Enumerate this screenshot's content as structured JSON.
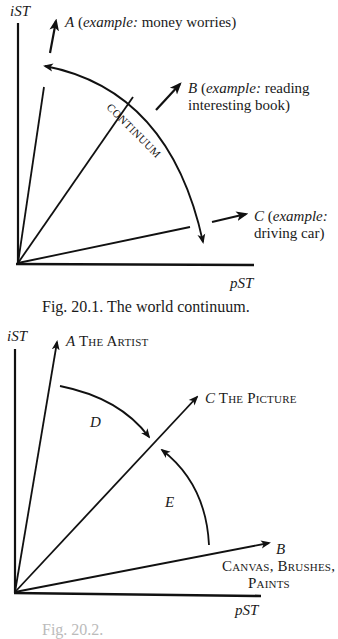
{
  "figure1": {
    "y_axis_label": "iST",
    "x_axis_label": "pST",
    "continuum_label": "CONTINUUM",
    "vectors": [
      {
        "letter": "A",
        "prefix": "(",
        "example_word": "example:",
        "text": " money worries)"
      },
      {
        "letter": "B",
        "prefix": "(",
        "example_word": "example:",
        "text": " reading",
        "text2": "interesting book)"
      },
      {
        "letter": "C",
        "prefix": "(",
        "example_word": "example:",
        "text2": "driving car)"
      }
    ],
    "caption": "Fig. 20.1.  The world continuum."
  },
  "figure2": {
    "y_axis_label": "iST",
    "x_axis_label": "pST",
    "vectors": [
      {
        "letter": "A",
        "label": "The Artist"
      },
      {
        "letter": "C",
        "label": "The Picture"
      },
      {
        "letter": "B",
        "label_line1": "Canvas, Brushes,",
        "label_line2": "Paints"
      }
    ],
    "arcs": [
      {
        "letter": "D"
      },
      {
        "letter": "E"
      }
    ],
    "caption": "Fig. 20.2."
  },
  "colors": {
    "ink": "#111111",
    "background": "#ffffff"
  }
}
